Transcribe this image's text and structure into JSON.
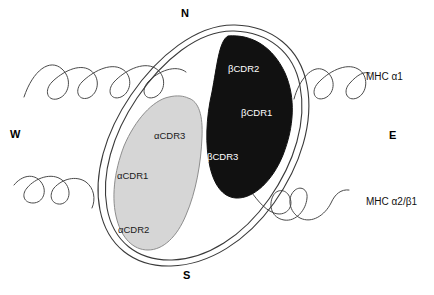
{
  "figure": {
    "type": "schematic-diagram",
    "background_color": "#ffffff",
    "outline_color": "#3a3a3a"
  },
  "compass": {
    "north": "N",
    "south": "S",
    "west": "W",
    "east": "E"
  },
  "helices": [
    {
      "id": "mhc-alpha1",
      "label": "MHC α1",
      "position": "upper",
      "stroke_color": "#4a4a4a"
    },
    {
      "id": "mhc-alpha2-beta1",
      "label": "MHC α2/β1",
      "position": "lower",
      "stroke_color": "#4a4a4a"
    }
  ],
  "footprint": {
    "name": "tcr-footprint-outline",
    "fill": "none",
    "stroke": "#3a3a3a"
  },
  "domains": [
    {
      "id": "alpha-chain",
      "name": "tcr-alpha-chain-blob",
      "fill_color": "#d6d6d6",
      "stroke_color": "#8d8d8d",
      "text_color": "#1a1a1a",
      "loops": [
        {
          "id": "acdr3",
          "label": "αCDR3"
        },
        {
          "id": "acdr1",
          "label": "αCDR1"
        },
        {
          "id": "acdr2",
          "label": "αCDR2"
        }
      ]
    },
    {
      "id": "beta-chain",
      "name": "tcr-beta-chain-blob",
      "fill_color": "#111111",
      "stroke_color": "#111111",
      "text_color": "#ffffff",
      "loops": [
        {
          "id": "bcdr2",
          "label": "βCDR2"
        },
        {
          "id": "bcdr1",
          "label": "βCDR1"
        },
        {
          "id": "bcdr3",
          "label": "βCDR3"
        }
      ]
    }
  ]
}
